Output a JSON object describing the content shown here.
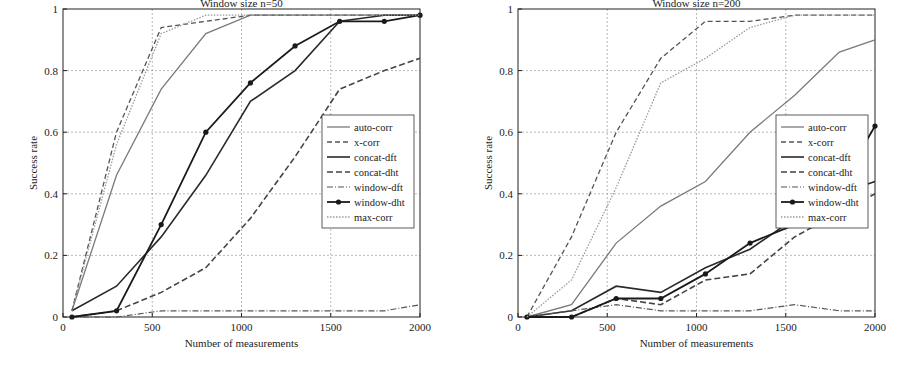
{
  "chart_data": [
    {
      "type": "line",
      "title": "Window size n=50",
      "xlabel": "Number of measurements",
      "ylabel": "Success rate",
      "xlim": [
        0,
        2000
      ],
      "ylim": [
        0,
        1
      ],
      "xticks": [
        0,
        500,
        1000,
        1500,
        2000
      ],
      "yticks": [
        0,
        0.2,
        0.4,
        0.6,
        0.8,
        1
      ],
      "grid": true,
      "legend_position": "right-center (inside)",
      "x": [
        50,
        300,
        550,
        800,
        1050,
        1300,
        1550,
        1800,
        2000
      ],
      "series": [
        {
          "name": "auto-corr",
          "style": "solid-gray",
          "values": [
            0.02,
            0.46,
            0.74,
            0.92,
            0.98,
            0.98,
            0.98,
            0.98,
            0.98
          ]
        },
        {
          "name": "x-corr",
          "style": "dashed-gray",
          "values": [
            0.02,
            0.6,
            0.94,
            0.96,
            0.98,
            0.98,
            0.98,
            0.98,
            0.98
          ]
        },
        {
          "name": "concat-dft",
          "style": "solid-black",
          "values": [
            0.02,
            0.1,
            0.26,
            0.46,
            0.7,
            0.8,
            0.96,
            0.98,
            0.98
          ]
        },
        {
          "name": "concat-dht",
          "style": "dashed-darkgray",
          "values": [
            0.0,
            0.02,
            0.08,
            0.16,
            0.32,
            0.52,
            0.74,
            0.8,
            0.84
          ]
        },
        {
          "name": "window-dft",
          "style": "dashdot-gray",
          "values": [
            0.0,
            0.0,
            0.02,
            0.02,
            0.02,
            0.02,
            0.02,
            0.02,
            0.04
          ]
        },
        {
          "name": "window-dht",
          "style": "solid-black-dots",
          "values": [
            0.0,
            0.02,
            0.3,
            0.6,
            0.76,
            0.88,
            0.96,
            0.96,
            0.98
          ]
        },
        {
          "name": "max-corr",
          "style": "dotted-lightgray",
          "values": [
            0.02,
            0.56,
            0.92,
            0.98,
            0.98,
            0.98,
            0.98,
            0.98,
            0.98
          ]
        }
      ]
    },
    {
      "type": "line",
      "title": "Window size n=200",
      "xlabel": "Number of measurements",
      "ylabel": "Success rate",
      "xlim": [
        0,
        2000
      ],
      "ylim": [
        0,
        1
      ],
      "xticks": [
        0,
        500,
        1000,
        1500,
        2000
      ],
      "yticks": [
        0,
        0.2,
        0.4,
        0.6,
        0.8,
        1
      ],
      "grid": true,
      "legend_position": "right-center (inside)",
      "x": [
        50,
        300,
        550,
        800,
        1050,
        1300,
        1550,
        1800,
        2000
      ],
      "series": [
        {
          "name": "auto-corr",
          "style": "solid-gray",
          "values": [
            0.0,
            0.04,
            0.24,
            0.36,
            0.44,
            0.6,
            0.72,
            0.86,
            0.9
          ]
        },
        {
          "name": "x-corr",
          "style": "dashed-gray",
          "values": [
            0.0,
            0.26,
            0.6,
            0.84,
            0.96,
            0.96,
            0.98,
            0.98,
            0.98
          ]
        },
        {
          "name": "concat-dft",
          "style": "solid-black",
          "values": [
            0.0,
            0.02,
            0.1,
            0.08,
            0.16,
            0.22,
            0.32,
            0.4,
            0.44
          ]
        },
        {
          "name": "concat-dht",
          "style": "dashed-darkgray",
          "values": [
            0.0,
            0.0,
            0.06,
            0.04,
            0.12,
            0.14,
            0.26,
            0.34,
            0.4
          ]
        },
        {
          "name": "window-dft",
          "style": "dashdot-gray",
          "values": [
            0.0,
            0.02,
            0.04,
            0.02,
            0.02,
            0.02,
            0.04,
            0.02,
            0.02
          ]
        },
        {
          "name": "window-dht",
          "style": "solid-black-dots",
          "values": [
            0.0,
            0.0,
            0.06,
            0.06,
            0.14,
            0.24,
            0.3,
            0.42,
            0.62
          ]
        },
        {
          "name": "max-corr",
          "style": "dotted-lightgray",
          "values": [
            0.0,
            0.12,
            0.42,
            0.76,
            0.84,
            0.94,
            0.98,
            0.98,
            0.98
          ]
        }
      ]
    }
  ]
}
